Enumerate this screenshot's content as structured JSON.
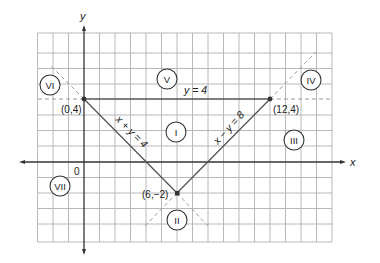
{
  "figure": {
    "axes": {
      "x_label": "x",
      "y_label": "y",
      "origin_label": "0"
    },
    "grid": {
      "x_min": -3,
      "x_max": 16,
      "y_min": -5,
      "y_max": 8.5
    },
    "lines": [
      {
        "equation": "y = 4",
        "label": "y = 4",
        "style": "solid"
      },
      {
        "equation": "x + y = 4",
        "label": "x + y = 4",
        "style": "solid"
      },
      {
        "equation": "x − y = 8",
        "label": "x − y = 8",
        "style": "solid"
      }
    ],
    "points": [
      {
        "label": "(0,4)",
        "x": 0,
        "y": 4
      },
      {
        "label": "(12,4)",
        "x": 12,
        "y": 4
      },
      {
        "label": "(6,−2)",
        "x": 6,
        "y": -2
      }
    ],
    "regions": [
      {
        "label": "I"
      },
      {
        "label": "II"
      },
      {
        "label": "III"
      },
      {
        "label": "IV"
      },
      {
        "label": "V"
      },
      {
        "label": "VI"
      },
      {
        "label": "VII"
      }
    ],
    "colors": {
      "grid": "#b8b8b8",
      "axis": "#333333",
      "line": "#555555",
      "dashed": "#9a9a9a"
    }
  }
}
